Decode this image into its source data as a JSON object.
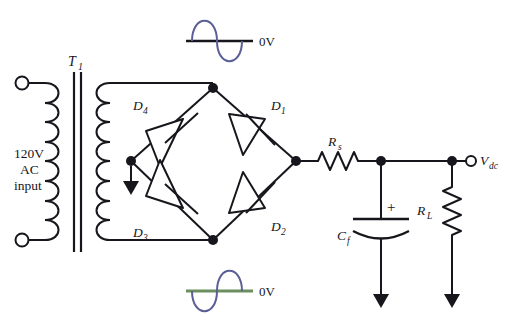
{
  "diagram": {
    "type": "schematic"
  },
  "colors": {
    "wire": "#16161c",
    "sine_wave": "#5a5f96",
    "zero_line_top": "#16161c",
    "zero_line_bottom": "#6b8f5e",
    "vdc_label": "#4a4f8c",
    "background": "#ffffff"
  },
  "source": {
    "label_line1": "120V",
    "label_line2": "AC",
    "label_line3": "input"
  },
  "transformer": {
    "label": "T",
    "subscript": "1"
  },
  "diodes": [
    {
      "id": "d4",
      "label": "D",
      "subscript": "4",
      "position": "top-left"
    },
    {
      "id": "d1",
      "label": "D",
      "subscript": "1",
      "position": "top-right"
    },
    {
      "id": "d3",
      "label": "D",
      "subscript": "3",
      "position": "bottom-left"
    },
    {
      "id": "d2",
      "label": "D",
      "subscript": "2",
      "position": "bottom-right"
    }
  ],
  "components": {
    "series_resistor": {
      "label": "R",
      "subscript": "s"
    },
    "filter_capacitor": {
      "label": "C",
      "subscript": "f",
      "polarity": "+"
    },
    "load_resistor": {
      "label": "R",
      "subscript": "L"
    }
  },
  "output": {
    "label": "V",
    "subscript": "dc"
  },
  "waveforms": [
    {
      "id": "input-waveform",
      "zero_label": "0V",
      "phase": "positive-first",
      "description": "AC sine wave at transformer secondary"
    },
    {
      "id": "output-waveform",
      "zero_label": "0V",
      "phase": "negative-first",
      "description": "AC sine wave reference at bridge bottom rail"
    }
  ]
}
